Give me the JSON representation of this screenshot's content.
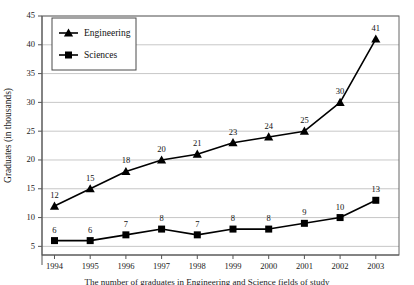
{
  "chart_data": {
    "type": "line",
    "title": "",
    "xlabel": "",
    "ylabel": "Graduates (in thousands)",
    "categories": [
      "1994",
      "1995",
      "1996",
      "1997",
      "1998",
      "1999",
      "2000",
      "2001",
      "2002",
      "2003"
    ],
    "series": [
      {
        "name": "Engineering",
        "marker": "triangle",
        "color": "#000000",
        "values": [
          12,
          15,
          18,
          20,
          21,
          23,
          24,
          25,
          30,
          41
        ],
        "point_labels": [
          "12",
          "15",
          "18",
          "20",
          "21",
          "23",
          "24",
          "25",
          "30",
          "41"
        ]
      },
      {
        "name": "Sciences",
        "marker": "square",
        "color": "#000000",
        "values": [
          6,
          6,
          7,
          8,
          7,
          8,
          8,
          9,
          10,
          13
        ],
        "point_labels": [
          "6",
          "6",
          "7",
          "8",
          "7",
          "8",
          "8",
          "9",
          "10",
          "13"
        ]
      }
    ],
    "ylim": [
      3.5,
      45
    ],
    "yticks": [
      5,
      10,
      15,
      20,
      25,
      30,
      35,
      40,
      45
    ],
    "ytick_labels": [
      "5",
      "10",
      "15",
      "20",
      "25",
      "30",
      "35",
      "40",
      "45"
    ],
    "grid": true,
    "grid_axis": "y",
    "legend_position": "top-left",
    "legend_entries": [
      "Engineering",
      "Sciences"
    ]
  },
  "caption": {
    "text": "The number of graduates in Engineering and Science fields of study"
  }
}
